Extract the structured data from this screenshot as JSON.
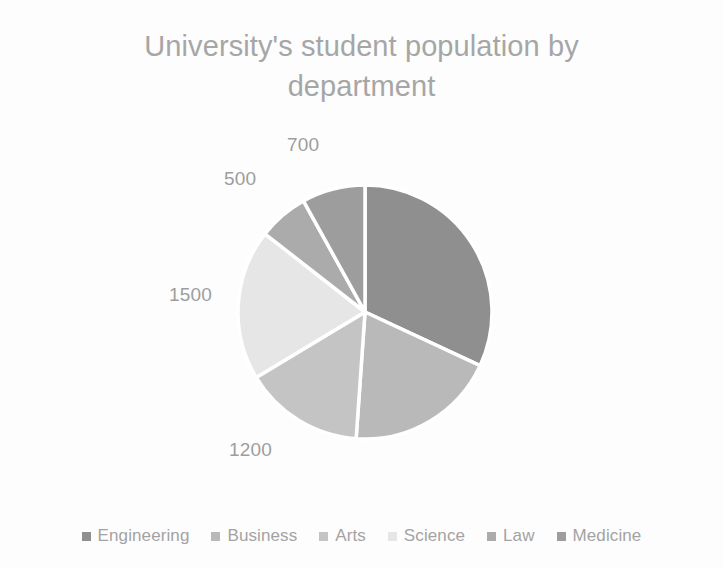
{
  "chart_data": {
    "type": "pie",
    "title": "University's student population by\ndepartment",
    "title_line1": "University's student population by",
    "title_line2": "department",
    "categories": [
      "Engineering",
      "Business",
      "Arts",
      "Science",
      "Law",
      "Medicine"
    ],
    "values": [
      2500,
      1500,
      1200,
      1500,
      500,
      700
    ],
    "visible_data_labels": [
      "700",
      "500",
      "1500",
      "1200"
    ],
    "slices": [
      {
        "label": "Engineering",
        "value": 2500,
        "data_label": "",
        "color": "#8f8f8f",
        "start_angle": 0,
        "end_angle": 115.0
      },
      {
        "label": "Business",
        "value": 1500,
        "data_label": "",
        "color": "#b9b9b9",
        "start_angle": 115.0,
        "end_angle": 184.0
      },
      {
        "label": "Arts",
        "value": 1200,
        "data_label": "1200",
        "color": "#c4c4c4",
        "start_angle": 184.0,
        "end_angle": 239.0
      },
      {
        "label": "Science",
        "value": 1500,
        "data_label": "1500",
        "color": "#e6e6e6",
        "start_angle": 239.0,
        "end_angle": 308.0
      },
      {
        "label": "Law",
        "value": 500,
        "data_label": "500",
        "color": "#ababab",
        "start_angle": 308.0,
        "end_angle": 331.0
      },
      {
        "label": "Medicine",
        "value": 700,
        "data_label": "700",
        "color": "#9d9d9d",
        "start_angle": 331.0,
        "end_angle": 360.0
      }
    ],
    "legend_position": "bottom",
    "grid": false,
    "xlabel": "",
    "ylabel": ""
  },
  "labels": {
    "medicine": "700",
    "law": "500",
    "science": "1500",
    "arts": "1200"
  },
  "legend": {
    "items": [
      {
        "label": "Engineering",
        "color": "#8f8f8f"
      },
      {
        "label": "Business",
        "color": "#b9b9b9"
      },
      {
        "label": "Arts",
        "color": "#c4c4c4"
      },
      {
        "label": "Science",
        "color": "#e6e6e6"
      },
      {
        "label": "Law",
        "color": "#ababab"
      },
      {
        "label": "Medicine",
        "color": "#9d9d9d"
      }
    ]
  },
  "colors": {
    "title_text": "#a6a6a6",
    "label_text": "#9d9d9d",
    "legend_text": "#a3a3a3",
    "background": "#fdfdfd",
    "slice_gap": "#ffffff"
  }
}
